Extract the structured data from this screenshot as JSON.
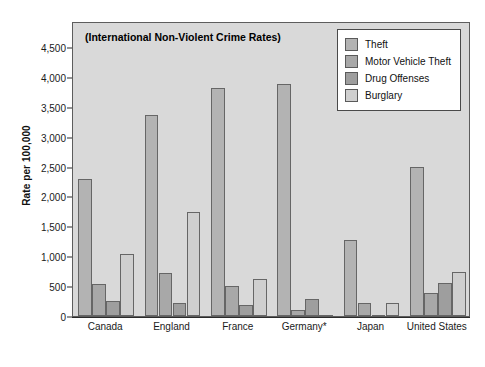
{
  "chart_data": {
    "type": "bar",
    "title": "(International Non-Violent Crime Rates)",
    "xlabel": "",
    "ylabel": "Rate per 100,000",
    "ylim": [
      0,
      4500
    ],
    "grid": false,
    "legend_position": "top-right",
    "categories": [
      "Canada",
      "England",
      "France",
      "Germany*",
      "Japan",
      "United States"
    ],
    "ytick_labels": [
      "0",
      "500",
      "1,000",
      "1,500",
      "2,000",
      "2,500",
      "3,000",
      "3,500",
      "4,000",
      "4,500"
    ],
    "ytick_values": [
      0,
      500,
      1000,
      1500,
      2000,
      2500,
      3000,
      3500,
      4000,
      4500
    ],
    "series": [
      {
        "name": "Theft",
        "color": "#b3b3b3",
        "values": [
          2300,
          3370,
          3820,
          3880,
          1275,
          2500
        ]
      },
      {
        "name": "Motor Vehicle Theft",
        "color": "#a8a8a8",
        "values": [
          540,
          715,
          495,
          100,
          210,
          380
        ]
      },
      {
        "name": "Drug Offenses",
        "color": "#9e9e9e",
        "values": [
          250,
          225,
          185,
          280,
          20,
          545
        ]
      },
      {
        "name": "Burglary",
        "color": "#cfcfcf",
        "values": [
          1030,
          1735,
          615,
          5,
          215,
          740
        ]
      }
    ]
  },
  "legend": {
    "items": [
      {
        "label": "Theft"
      },
      {
        "label": "Motor Vehicle Theft"
      },
      {
        "label": "Drug Offenses"
      },
      {
        "label": "Burglary"
      }
    ]
  },
  "colors": {
    "plot_background": "#d9d9d9",
    "frame": "#5d5d5d",
    "legend_background": "#ffffff",
    "bar_outline": "#666666"
  }
}
